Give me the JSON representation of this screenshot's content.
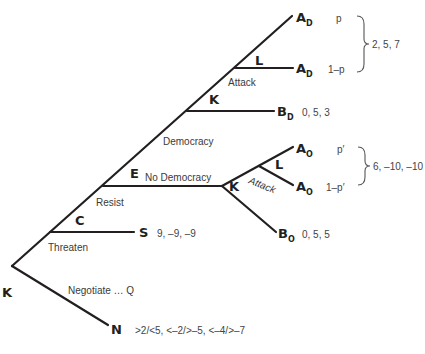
{
  "diagram": {
    "type": "game-tree",
    "decision_nodes": {
      "root": "K",
      "threaten": "C",
      "resist": "E",
      "democracy": "K",
      "attack_democracy": "L",
      "no_democracy": "K",
      "attack_no_democracy": "L"
    },
    "edge_labels": {
      "threaten": "Threaten",
      "negotiate": "Negotiate … Q",
      "resist": "Resist",
      "democracy": "Democracy",
      "no_democracy": "No Democracy",
      "attack_democracy": "Attack",
      "attack_no_democracy": "Attack"
    },
    "terminals": {
      "AD_top": {
        "letter": "A",
        "sub": "D",
        "prob": "p"
      },
      "AD_bottom": {
        "letter": "A",
        "sub": "D",
        "prob": "1–p"
      },
      "BD": {
        "letter": "B",
        "sub": "D",
        "payoff": "0, 5, 3"
      },
      "AO_top": {
        "letter": "A",
        "sub": "O",
        "prob": "p′"
      },
      "AO_bottom": {
        "letter": "A",
        "sub": "O",
        "prob": "1–p′"
      },
      "BO": {
        "letter": "B",
        "sub": "O",
        "payoff": "0, 5, 5"
      },
      "S": {
        "letter": "S",
        "payoff": "9, –9, –9"
      },
      "N": {
        "letter": "N",
        "payoff": ">2/<5,  <–2/>–5,  <–4/>–7"
      }
    },
    "grouped_payoffs": {
      "AD": "2, 5, 7",
      "AO": "6, –10, –10"
    }
  }
}
